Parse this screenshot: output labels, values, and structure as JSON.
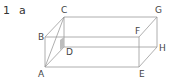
{
  "problem": {
    "number": "1",
    "part": "a"
  },
  "diagram": {
    "type": "rectangular-prism",
    "line_color": "#9a9a9a",
    "shade_color": "#bdbdbd",
    "vertices": {
      "A": {
        "label": "A",
        "x": 45,
        "y": 67
      },
      "B": {
        "label": "B",
        "x": 45,
        "y": 37
      },
      "C": {
        "label": "C",
        "x": 64,
        "y": 17
      },
      "D": {
        "label": "D",
        "x": 64,
        "y": 47
      },
      "E": {
        "label": "E",
        "x": 139,
        "y": 67
      },
      "F": {
        "label": "F",
        "x": 139,
        "y": 37
      },
      "G": {
        "label": "G",
        "x": 157,
        "y": 17
      },
      "H": {
        "label": "H",
        "x": 157,
        "y": 47
      }
    }
  }
}
